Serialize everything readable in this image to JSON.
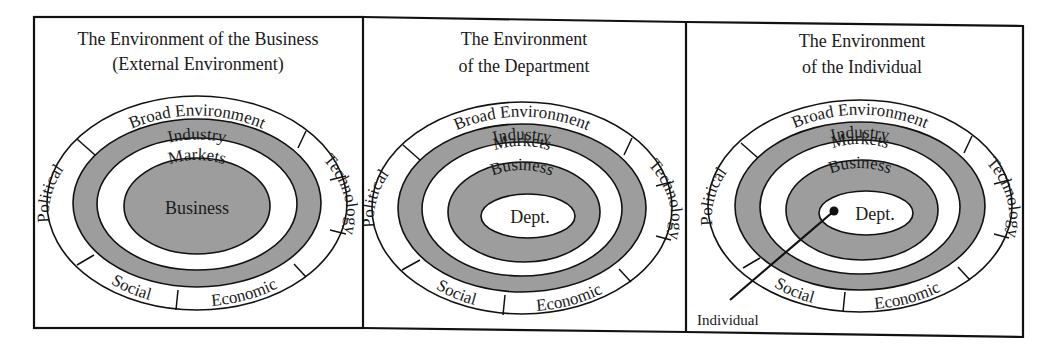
{
  "panels": [
    {
      "title_line1": "The Environment of the Business",
      "title_line2": "(External Environment)",
      "ring": {
        "top": "Broad Environment",
        "left": "Political",
        "right": "Technology",
        "bottom_left": "Social",
        "bottom_right": "Economic"
      },
      "layers": [
        "Industry",
        "Markets"
      ],
      "center": "Business"
    },
    {
      "title_line1": "The Environment",
      "title_line2": "of the Department",
      "ring": {
        "top": "Broad Environment",
        "left": "Political",
        "right": "Technology",
        "bottom_left": "Social",
        "bottom_right": "Economic"
      },
      "layers": [
        "Industry",
        "Markets",
        "Business"
      ],
      "center": "Dept."
    },
    {
      "title_line1": "The Environment",
      "title_line2": "of the Individual",
      "ring": {
        "top": "Broad Environment",
        "left": "Political",
        "right": "Technology",
        "bottom_left": "Social",
        "bottom_right": "Economic"
      },
      "layers": [
        "Industry",
        "Markets",
        "Business"
      ],
      "center": "Dept.",
      "pointer_label": "Individual"
    }
  ],
  "colors": {
    "shade": "#9d9d9d",
    "ink": "#111111",
    "paper": "#ffffff"
  }
}
